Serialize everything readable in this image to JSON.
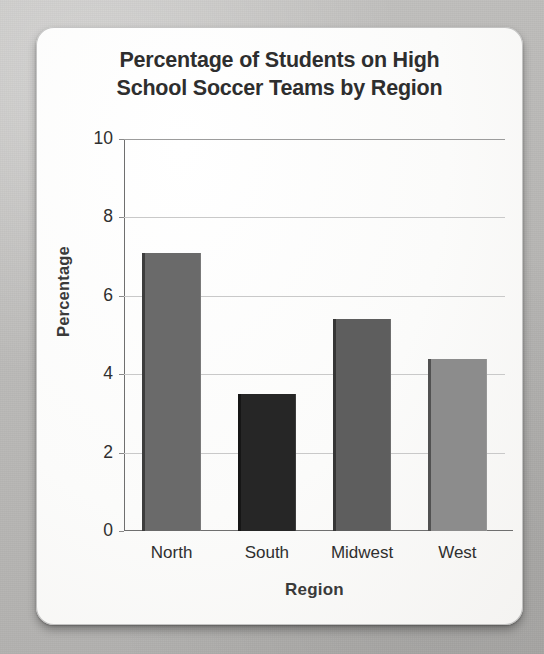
{
  "chart_data": {
    "type": "bar",
    "title": "Percentage of Students on High School Soccer Teams by Region",
    "title_lines": [
      "Percentage of Students on High",
      "School Soccer Teams by Region"
    ],
    "categories": [
      "North",
      "South",
      "Midwest",
      "West"
    ],
    "values": [
      7.1,
      3.5,
      5.4,
      4.4
    ],
    "xlabel": "Region",
    "ylabel": "Percentage",
    "ylim": [
      0,
      10
    ],
    "yticks": [
      0,
      2,
      4,
      6,
      8,
      10
    ],
    "ytick_labels": [
      "0",
      "2",
      "4",
      "6",
      "8",
      "10"
    ],
    "grid": true,
    "legend": false,
    "bar_colors": [
      "#6a6a6a",
      "#262626",
      "#5e5e5e",
      "#8c8c8c"
    ]
  },
  "card": {
    "background_color": "#fbfbfa",
    "page_background_color": "#bcbbb9"
  }
}
